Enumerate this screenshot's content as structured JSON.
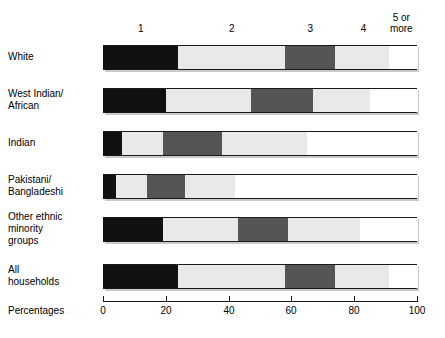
{
  "chart_data": {
    "type": "bar",
    "orientation": "horizontal",
    "stacked": true,
    "title": "",
    "subtitle": "",
    "xlabel": "Percentages",
    "ylabel": "",
    "xlim": [
      0,
      100
    ],
    "xticks": [
      0,
      20,
      40,
      60,
      80,
      100
    ],
    "xtick_labels": [
      "0",
      "20",
      "40",
      "60",
      "80",
      "100"
    ],
    "grid": false,
    "legend_position": "top",
    "legend_note": "Column headers above the bars indicate number of persons in household",
    "categories": [
      "White",
      "West Indian/\nAfrican",
      "Indian",
      "Pakistani/\nBangladeshi",
      "Other ethnic\nminority\ngroups",
      "All\nhouseholds"
    ],
    "series": [
      {
        "name": "1",
        "label": "1",
        "color": "#111111",
        "values": [
          24,
          20,
          6,
          4,
          19,
          24
        ]
      },
      {
        "name": "2",
        "label": "2",
        "color": "#e9e9e9",
        "values": [
          34,
          27,
          13,
          10,
          24,
          34
        ]
      },
      {
        "name": "3",
        "label": "3",
        "color": "#555555",
        "values": [
          16,
          20,
          19,
          12,
          16,
          16
        ]
      },
      {
        "name": "4",
        "label": "4",
        "color": "#e9e9e9",
        "values": [
          17,
          18,
          27,
          16,
          23,
          17
        ]
      },
      {
        "name": "5 or more",
        "label": "5 or\nmore",
        "color": "#ffffff",
        "values": [
          9,
          15,
          35,
          58,
          18,
          9
        ]
      }
    ],
    "cumulative_boundaries": [
      [
        24,
        58,
        74,
        91,
        100
      ],
      [
        20,
        47,
        67,
        85,
        100
      ],
      [
        6,
        19,
        38,
        65,
        100
      ],
      [
        4,
        14,
        26,
        42,
        100
      ],
      [
        19,
        43,
        59,
        82,
        100
      ],
      [
        24,
        58,
        74,
        91,
        100
      ]
    ]
  },
  "axis": {
    "title": "Percentages",
    "ticks": [
      {
        "label": "0",
        "value": 0
      },
      {
        "label": "20",
        "value": 20
      },
      {
        "label": "40",
        "value": 40
      },
      {
        "label": "60",
        "value": 60
      },
      {
        "label": "80",
        "value": 80
      },
      {
        "label": "100",
        "value": 100
      }
    ]
  },
  "column_headers": [
    {
      "label": "1",
      "center_pct": 12
    },
    {
      "label": "2",
      "center_pct": 41
    },
    {
      "label": "3",
      "center_pct": 66
    },
    {
      "label": "4",
      "center_pct": 83
    },
    {
      "label": "5 or\nmore",
      "center_pct": 95
    }
  ],
  "rows": [
    {
      "label": "White"
    },
    {
      "label": "West Indian/\nAfrican"
    },
    {
      "label": "Indian"
    },
    {
      "label": "Pakistani/\nBangladeshi"
    },
    {
      "label": "Other ethnic\nminority\ngroups"
    },
    {
      "label": "All\nhouseholds"
    }
  ],
  "colors": {
    "series_1": "#111111",
    "series_2": "#e9e9e9",
    "series_3": "#555555",
    "series_4": "#e9e9e9",
    "series_5": "#ffffff",
    "outline": "#1a1a1a",
    "shadow": "#c9c9c9",
    "background": "#ffffff"
  }
}
